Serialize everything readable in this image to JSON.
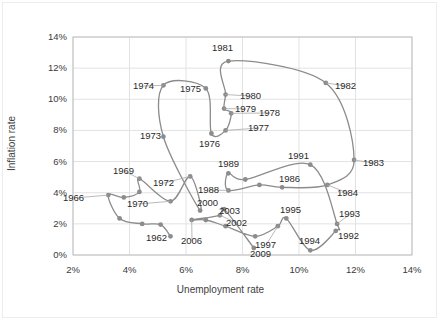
{
  "chart_data": {
    "type": "line",
    "title": "",
    "subtitle": "",
    "xlabel": "Unemployment rate",
    "ylabel": "Inflation rate",
    "xlim": [
      2,
      14
    ],
    "ylim": [
      0,
      14
    ],
    "xticks": [
      "2%",
      "4%",
      "6%",
      "8%",
      "10%",
      "12%",
      "14%"
    ],
    "yticks": [
      "0%",
      "2%",
      "4%",
      "6%",
      "8%",
      "10%",
      "12%",
      "14%"
    ],
    "xtick_values": [
      2,
      4,
      6,
      8,
      10,
      12,
      14
    ],
    "ytick_values": [
      0,
      2,
      4,
      6,
      8,
      10,
      12,
      14
    ],
    "grid": true,
    "legend": "none",
    "series_name": "Unemployment vs Inflation",
    "series_color": "#8c8c8c",
    "marker_color": "#8c8c8c",
    "x": [
      5.5,
      5.5,
      5.7,
      5.2,
      4.5,
      3.8,
      3.8,
      3.6,
      3.5,
      4.9,
      5.9,
      5.6,
      5.6,
      4.9,
      5.6,
      8.5,
      7.7,
      7.1,
      6.1,
      5.8,
      7.1,
      7.6,
      9.7,
      9.6,
      7.5,
      7.2,
      7.0,
      6.2,
      5.5,
      5.3,
      5.6,
      6.8,
      7.5,
      6.9,
      6.1,
      5.6,
      5.4,
      4.9,
      4.5,
      4.2,
      4.0,
      4.7,
      5.8,
      6.0,
      5.5,
      5.1,
      4.6,
      4.6,
      5.8,
      9.3
    ],
    "data_points": [
      {
        "label": "1962",
        "x": 5.45,
        "y": 1.2
      },
      {
        "label": "1966",
        "x": 3.25,
        "y": 3.85
      },
      {
        "label": "1969",
        "x": 4.35,
        "y": 4.9
      },
      {
        "label": "1970",
        "x": 5.45,
        "y": 3.45
      },
      {
        "label": "1972",
        "x": 6.15,
        "y": 5.05
      },
      {
        "label": "1973",
        "x": 5.2,
        "y": 7.6
      },
      {
        "label": "1974",
        "x": 5.2,
        "y": 10.9
      },
      {
        "label": "1975",
        "x": 6.7,
        "y": 10.7
      },
      {
        "label": "1976",
        "x": 6.9,
        "y": 7.8
      },
      {
        "label": "1977",
        "x": 7.4,
        "y": 8.0
      },
      {
        "label": "1978",
        "x": 7.6,
        "y": 9.1
      },
      {
        "label": "1979",
        "x": 7.35,
        "y": 9.4
      },
      {
        "label": "1980",
        "x": 7.4,
        "y": 10.3
      },
      {
        "label": "1981",
        "x": 7.5,
        "y": 12.45
      },
      {
        "label": "1982",
        "x": 10.95,
        "y": 11.05
      },
      {
        "label": "1983",
        "x": 11.95,
        "y": 6.1
      },
      {
        "label": "1984",
        "x": 11.0,
        "y": 4.5
      },
      {
        "label": "1986",
        "x": 9.4,
        "y": 4.35
      },
      {
        "label": "1988",
        "x": 7.5,
        "y": 4.15
      },
      {
        "label": "1989",
        "x": 7.5,
        "y": 5.25
      },
      {
        "label": "1991",
        "x": 10.4,
        "y": 5.8
      },
      {
        "label": "1992",
        "x": 11.3,
        "y": 1.55
      },
      {
        "label": "1993",
        "x": 11.35,
        "y": 2.0
      },
      {
        "label": "1994",
        "x": 10.4,
        "y": 0.3
      },
      {
        "label": "1995",
        "x": 9.55,
        "y": 2.35
      },
      {
        "label": "1997",
        "x": 9.25,
        "y": 1.85
      },
      {
        "label": "2000",
        "x": 6.5,
        "y": 2.85
      },
      {
        "label": "2002",
        "x": 7.2,
        "y": 2.55
      },
      {
        "label": "2003",
        "x": 7.35,
        "y": 2.95
      },
      {
        "label": "2006",
        "x": 6.2,
        "y": 2.25
      },
      {
        "label": "2009",
        "x": 8.4,
        "y": 0.45
      }
    ],
    "path": [
      [
        5.45,
        1.2
      ],
      [
        5.1,
        1.95
      ],
      [
        4.45,
        2.0
      ],
      [
        3.65,
        2.35
      ],
      [
        3.25,
        3.85
      ],
      [
        3.8,
        3.7
      ],
      [
        4.35,
        4.05
      ],
      [
        4.35,
        4.9
      ],
      [
        5.45,
        3.45
      ],
      [
        6.15,
        5.05
      ],
      [
        6.5,
        2.85
      ],
      [
        5.2,
        7.6
      ],
      [
        5.2,
        10.9
      ],
      [
        6.7,
        10.7
      ],
      [
        6.9,
        7.8
      ],
      [
        7.4,
        8.0
      ],
      [
        7.6,
        9.1
      ],
      [
        7.35,
        9.4
      ],
      [
        7.4,
        10.3
      ],
      [
        7.5,
        12.45
      ],
      [
        10.95,
        11.05
      ],
      [
        11.95,
        6.1
      ],
      [
        11.0,
        4.5
      ],
      [
        9.4,
        4.35
      ],
      [
        8.6,
        4.5
      ],
      [
        7.5,
        4.15
      ],
      [
        7.5,
        5.25
      ],
      [
        8.1,
        4.85
      ],
      [
        10.4,
        5.8
      ],
      [
        11.35,
        2.0
      ],
      [
        11.3,
        1.55
      ],
      [
        10.4,
        0.3
      ],
      [
        9.55,
        2.35
      ],
      [
        9.25,
        1.85
      ],
      [
        8.45,
        1.2
      ],
      [
        7.4,
        1.85
      ],
      [
        6.7,
        2.25
      ],
      [
        6.2,
        2.25
      ],
      [
        7.2,
        2.55
      ],
      [
        7.35,
        2.95
      ],
      [
        8.4,
        0.45
      ]
    ],
    "point_labels": [
      {
        "text": "1962",
        "px": 146,
        "py": 232
      },
      {
        "text": "1966",
        "px": 63,
        "py": 192
      },
      {
        "text": "1969",
        "px": 113,
        "py": 165
      },
      {
        "text": "1970",
        "px": 127,
        "py": 198
      },
      {
        "text": "1972",
        "px": 153,
        "py": 177
      },
      {
        "text": "1973",
        "px": 140,
        "py": 130
      },
      {
        "text": "1974",
        "px": 133,
        "py": 80
      },
      {
        "text": "1975",
        "px": 180,
        "py": 83
      },
      {
        "text": "1976",
        "px": 199,
        "py": 138
      },
      {
        "text": "1977",
        "px": 248,
        "py": 122
      },
      {
        "text": "1978",
        "px": 259,
        "py": 107
      },
      {
        "text": "1979",
        "px": 235,
        "py": 103
      },
      {
        "text": "1980",
        "px": 240,
        "py": 90
      },
      {
        "text": "1981",
        "px": 212,
        "py": 42
      },
      {
        "text": "1982",
        "px": 335,
        "py": 80
      },
      {
        "text": "1983",
        "px": 363,
        "py": 157
      },
      {
        "text": "1984",
        "px": 337,
        "py": 187
      },
      {
        "text": "1986",
        "px": 279,
        "py": 173
      },
      {
        "text": "1988",
        "px": 198,
        "py": 184
      },
      {
        "text": "1989",
        "px": 218,
        "py": 158
      },
      {
        "text": "1991",
        "px": 288,
        "py": 150
      },
      {
        "text": "1992",
        "px": 338,
        "py": 230
      },
      {
        "text": "1993",
        "px": 339,
        "py": 208
      },
      {
        "text": "1994",
        "px": 299,
        "py": 235
      },
      {
        "text": "1995",
        "px": 280,
        "py": 204
      },
      {
        "text": "1997",
        "px": 255,
        "py": 239
      },
      {
        "text": "2000",
        "px": 197,
        "py": 197
      },
      {
        "text": "2002",
        "px": 226,
        "py": 217
      },
      {
        "text": "2003",
        "px": 219,
        "py": 205
      },
      {
        "text": "2006",
        "px": 181,
        "py": 235
      },
      {
        "text": "2009",
        "px": 250,
        "py": 248
      }
    ]
  },
  "axes": {
    "x_title": "Unemployment rate",
    "y_title": "Inflation rate"
  }
}
